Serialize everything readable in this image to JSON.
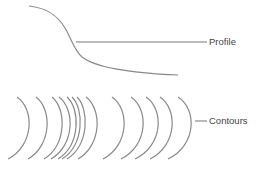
{
  "diagram": {
    "labels": {
      "profile": "Profile",
      "contours": "Contours"
    },
    "colors": {
      "line": "#8a8a8a",
      "leader": "#777777",
      "text": "#444444"
    },
    "profile_curve": "M29,6 C48,8 58,16 65,28 C72,40 74,50 82,57 C96,68 130,73 178,75",
    "profile_leader": {
      "x1": 76,
      "y1": 42,
      "x2": 207,
      "y2": 42
    },
    "contour_leader": {
      "x1": 195,
      "y1": 121,
      "x2": 207,
      "y2": 121
    },
    "contour_arcs": [
      {
        "top": 17,
        "bulge": 29,
        "bottom": 8
      },
      {
        "top": 36,
        "bulge": 47,
        "bottom": 28
      },
      {
        "top": 52,
        "bulge": 62,
        "bottom": 44
      },
      {
        "top": 59,
        "bulge": 70,
        "bottom": 51
      },
      {
        "top": 67,
        "bulge": 76,
        "bottom": 58
      },
      {
        "top": 72,
        "bulge": 80,
        "bottom": 62
      },
      {
        "top": 77,
        "bulge": 85,
        "bottom": 67
      },
      {
        "top": 86,
        "bulge": 97,
        "bottom": 78
      },
      {
        "top": 112,
        "bulge": 124,
        "bottom": 103
      },
      {
        "top": 131,
        "bulge": 143,
        "bottom": 121
      },
      {
        "top": 146,
        "bulge": 158,
        "bottom": 135
      },
      {
        "top": 160,
        "bulge": 172,
        "bottom": 150
      },
      {
        "top": 178,
        "bulge": 191,
        "bottom": 168
      }
    ]
  }
}
